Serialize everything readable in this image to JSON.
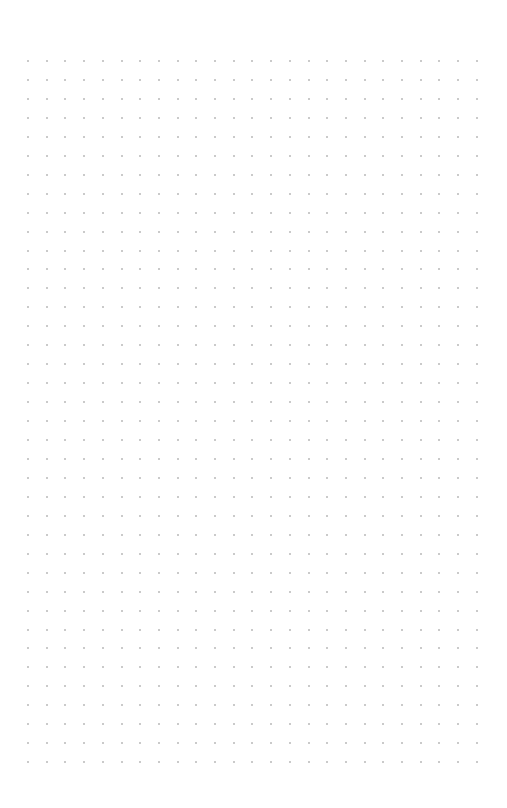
{
  "page": {
    "type": "dot-grid-paper",
    "background": "#ffffff",
    "dot_color": "#b8b8b8",
    "grid": {
      "columns": 25,
      "rows": 38,
      "origin_x": 28,
      "origin_y": 61,
      "spacing_x": 18.7,
      "spacing_y": 18.95
    }
  }
}
